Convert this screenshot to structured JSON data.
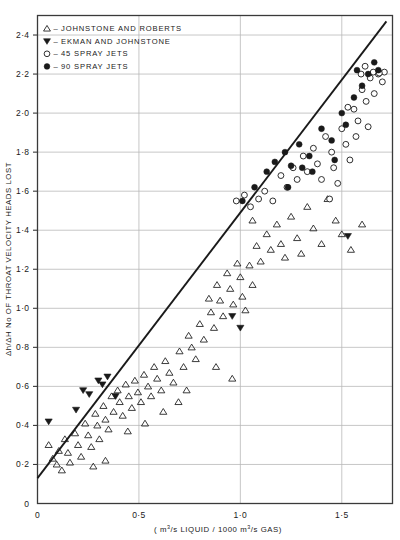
{
  "chart_data": {
    "type": "scatter",
    "title": "",
    "xlabel": "( m3/s LIQUID / 1000  m3/s  GAS)",
    "ylabel": "Δh/ΔH  No OF THROAT VELOCITY HEADS LOST",
    "xlim": [
      0,
      1.75
    ],
    "ylim": [
      0,
      2.5
    ],
    "xticks": [
      0,
      0.5,
      1.0,
      1.5
    ],
    "xtick_labels": [
      "0",
      "0·5",
      "1·0",
      "1·5"
    ],
    "yticks": [
      0,
      0.2,
      0.4,
      0.6,
      0.8,
      1.0,
      1.2,
      1.4,
      1.6,
      1.8,
      2.0,
      2.2,
      2.4
    ],
    "ytick_labels": [
      "0",
      "0·2",
      "0·4",
      "0·6",
      "0·8",
      "1·0",
      "1·2",
      "1·4",
      "1·6",
      "1·8",
      "2·0",
      "2·2",
      "2·4"
    ],
    "grid": "horizontal-and-vertical",
    "legend_position": "top-left",
    "trend_line": {
      "label": "correlation line",
      "x": [
        0.0,
        1.72
      ],
      "y": [
        0.13,
        2.47
      ]
    },
    "series": [
      {
        "name": "JOHNSTONE AND ROBERTS",
        "marker": "open-triangle-up",
        "color": "#1a1a1a",
        "points": [
          [
            0.055,
            0.3
          ],
          [
            0.075,
            0.23
          ],
          [
            0.095,
            0.2
          ],
          [
            0.105,
            0.27
          ],
          [
            0.12,
            0.17
          ],
          [
            0.135,
            0.33
          ],
          [
            0.15,
            0.26
          ],
          [
            0.16,
            0.21
          ],
          [
            0.185,
            0.36
          ],
          [
            0.2,
            0.3
          ],
          [
            0.215,
            0.24
          ],
          [
            0.235,
            0.41
          ],
          [
            0.25,
            0.35
          ],
          [
            0.265,
            0.29
          ],
          [
            0.285,
            0.46
          ],
          [
            0.295,
            0.4
          ],
          [
            0.305,
            0.33
          ],
          [
            0.325,
            0.5
          ],
          [
            0.335,
            0.43
          ],
          [
            0.35,
            0.38
          ],
          [
            0.365,
            0.55
          ],
          [
            0.375,
            0.47
          ],
          [
            0.395,
            0.58
          ],
          [
            0.405,
            0.52
          ],
          [
            0.42,
            0.45
          ],
          [
            0.435,
            0.61
          ],
          [
            0.45,
            0.55
          ],
          [
            0.465,
            0.49
          ],
          [
            0.48,
            0.63
          ],
          [
            0.495,
            0.57
          ],
          [
            0.51,
            0.52
          ],
          [
            0.525,
            0.66
          ],
          [
            0.545,
            0.6
          ],
          [
            0.56,
            0.55
          ],
          [
            0.575,
            0.7
          ],
          [
            0.59,
            0.64
          ],
          [
            0.61,
            0.58
          ],
          [
            0.63,
            0.73
          ],
          [
            0.65,
            0.67
          ],
          [
            0.67,
            0.62
          ],
          [
            0.7,
            0.78
          ],
          [
            0.72,
            0.7
          ],
          [
            0.745,
            0.86
          ],
          [
            0.76,
            0.8
          ],
          [
            0.78,
            0.74
          ],
          [
            0.8,
            0.92
          ],
          [
            0.82,
            0.84
          ],
          [
            0.845,
            1.05
          ],
          [
            0.855,
            0.98
          ],
          [
            0.87,
            0.9
          ],
          [
            0.885,
            1.12
          ],
          [
            0.9,
            1.04
          ],
          [
            0.915,
            0.96
          ],
          [
            0.935,
            1.18
          ],
          [
            0.95,
            1.1
          ],
          [
            0.965,
            1.02
          ],
          [
            0.985,
            1.23
          ],
          [
            1.0,
            1.16
          ],
          [
            1.01,
            1.06
          ],
          [
            1.025,
            0.99
          ],
          [
            1.045,
            1.22
          ],
          [
            1.06,
            1.12
          ],
          [
            1.08,
            1.32
          ],
          [
            1.1,
            1.24
          ],
          [
            1.13,
            1.38
          ],
          [
            1.15,
            1.3
          ],
          [
            1.18,
            1.43
          ],
          [
            1.2,
            1.33
          ],
          [
            1.22,
            1.26
          ],
          [
            1.25,
            1.47
          ],
          [
            1.28,
            1.36
          ],
          [
            1.3,
            1.28
          ],
          [
            1.33,
            1.52
          ],
          [
            1.36,
            1.41
          ],
          [
            1.4,
            1.33
          ],
          [
            1.43,
            1.56
          ],
          [
            1.47,
            1.45
          ],
          [
            1.5,
            1.38
          ],
          [
            1.545,
            1.3
          ],
          [
            1.6,
            1.43
          ],
          [
            0.445,
            0.37
          ],
          [
            0.62,
            0.47
          ],
          [
            0.695,
            0.52
          ],
          [
            0.88,
            0.7
          ],
          [
            0.96,
            0.64
          ],
          [
            1.06,
            1.45
          ],
          [
            0.735,
            0.58
          ],
          [
            0.53,
            0.41
          ],
          [
            0.335,
            0.22
          ],
          [
            0.275,
            0.19
          ]
        ]
      },
      {
        "name": "EKMAN AND JOHNSTONE",
        "marker": "filled-triangle-down",
        "color": "#1a1a1a",
        "points": [
          [
            0.055,
            0.42
          ],
          [
            0.225,
            0.58
          ],
          [
            0.255,
            0.56
          ],
          [
            0.3,
            0.63
          ],
          [
            0.32,
            0.61
          ],
          [
            0.345,
            0.65
          ],
          [
            0.385,
            0.55
          ],
          [
            0.19,
            0.48
          ],
          [
            0.96,
            0.96
          ],
          [
            1.0,
            0.9
          ],
          [
            1.53,
            1.37
          ]
        ]
      },
      {
        "name": "45 SPRAY JETS",
        "marker": "open-circle",
        "color": "#1a1a1a",
        "points": [
          [
            1.05,
            1.52
          ],
          [
            1.09,
            1.56
          ],
          [
            1.12,
            1.6
          ],
          [
            1.16,
            1.55
          ],
          [
            1.2,
            1.68
          ],
          [
            1.23,
            1.62
          ],
          [
            1.26,
            1.72
          ],
          [
            1.28,
            1.66
          ],
          [
            1.31,
            1.78
          ],
          [
            1.33,
            1.7
          ],
          [
            1.36,
            1.82
          ],
          [
            1.38,
            1.74
          ],
          [
            1.4,
            1.66
          ],
          [
            1.42,
            1.88
          ],
          [
            1.45,
            1.8
          ],
          [
            1.46,
            1.72
          ],
          [
            1.48,
            1.64
          ],
          [
            1.5,
            1.92
          ],
          [
            1.52,
            1.84
          ],
          [
            1.54,
            1.76
          ],
          [
            1.56,
            2.02
          ],
          [
            1.58,
            1.96
          ],
          [
            1.6,
            2.12
          ],
          [
            1.62,
            2.06
          ],
          [
            1.64,
            2.18
          ],
          [
            1.66,
            2.1
          ],
          [
            1.68,
            2.2
          ],
          [
            1.7,
            2.16
          ],
          [
            1.71,
            2.21
          ],
          [
            1.44,
            1.56
          ],
          [
            1.63,
            1.93
          ],
          [
            1.57,
            1.88
          ],
          [
            0.98,
            1.55
          ],
          [
            1.02,
            1.58
          ],
          [
            1.53,
            2.03
          ],
          [
            1.655,
            2.21
          ],
          [
            1.685,
            2.205
          ],
          [
            1.595,
            2.2
          ],
          [
            1.615,
            2.24
          ]
        ]
      },
      {
        "name": "90 SPRAY JETS",
        "marker": "filled-circle",
        "color": "#1a1a1a",
        "points": [
          [
            1.01,
            1.55
          ],
          [
            1.07,
            1.62
          ],
          [
            1.13,
            1.7
          ],
          [
            1.17,
            1.75
          ],
          [
            1.22,
            1.8
          ],
          [
            1.25,
            1.73
          ],
          [
            1.29,
            1.84
          ],
          [
            1.34,
            1.78
          ],
          [
            1.4,
            1.92
          ],
          [
            1.45,
            1.86
          ],
          [
            1.5,
            2.0
          ],
          [
            1.52,
            1.94
          ],
          [
            1.56,
            2.08
          ],
          [
            1.6,
            2.14
          ],
          [
            1.63,
            2.2
          ],
          [
            1.66,
            2.26
          ],
          [
            1.68,
            2.22
          ],
          [
            1.355,
            1.7
          ],
          [
            1.465,
            1.76
          ],
          [
            1.575,
            2.22
          ],
          [
            1.235,
            1.62
          ],
          [
            1.305,
            1.72
          ]
        ]
      }
    ]
  },
  "legend": {
    "entries": [
      {
        "marker": "open-triangle-up",
        "dash": "–",
        "label": "JOHNSTONE AND ROBERTS"
      },
      {
        "marker": "filled-triangle-down",
        "dash": "–",
        "label": "EKMAN AND JOHNSTONE"
      },
      {
        "marker": "open-circle",
        "dash": "–",
        "label": "45  SPRAY  JETS"
      },
      {
        "marker": "filled-circle",
        "dash": "–",
        "label": "90  SPRAY  JETS"
      }
    ]
  },
  "axis_text": {
    "x_prefix": "( m",
    "x_sup1": "3",
    "x_mid": "/s  LIQUID / 1000   m",
    "x_sup2": "3",
    "x_suffix": "/s  GAS)",
    "y_label": "Δh/ΔH  No OF THROAT VELOCITY HEADS LOST"
  },
  "colors": {
    "ink": "#1a1a1a",
    "grid": "#b9b9b9",
    "frame": "#3a3a3a",
    "marker": "#1a1a1a",
    "background": "#ffffff"
  }
}
